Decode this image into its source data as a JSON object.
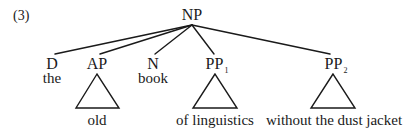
{
  "example_number": "(3)",
  "tree": {
    "root": {
      "label": "NP"
    },
    "children": [
      {
        "label": "D",
        "subscript": "",
        "word": "the",
        "triangle": false
      },
      {
        "label": "AP",
        "subscript": "",
        "word": "old",
        "triangle": true
      },
      {
        "label": "N",
        "subscript": "",
        "word": "book",
        "triangle": false
      },
      {
        "label": "PP",
        "subscript": "1",
        "word": "of linguistics",
        "triangle": true
      },
      {
        "label": "PP",
        "subscript": "2",
        "word": "without the dust jacket",
        "triangle": true
      }
    ]
  },
  "colors": {
    "ink": "#1a1a1a",
    "background": "#ffffff"
  }
}
